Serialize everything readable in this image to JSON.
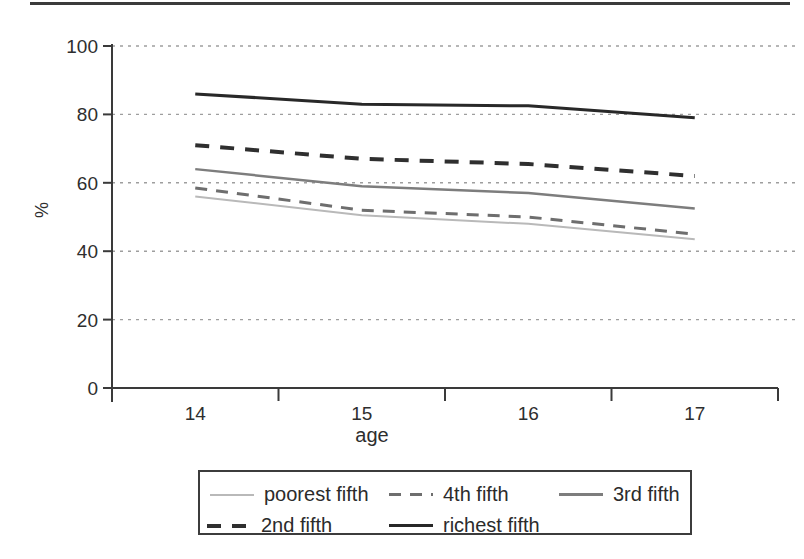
{
  "chart_data": {
    "type": "line",
    "title": "",
    "xlabel": "age",
    "ylabel": "%",
    "x": [
      "14",
      "15",
      "16",
      "17"
    ],
    "ylim": [
      0,
      100
    ],
    "yticks": [
      0,
      20,
      40,
      60,
      80,
      100
    ],
    "grid": "horizontal-dashed",
    "legend_position": "bottom-box",
    "axis_color": "#3a3a3a",
    "gridline_color": "#9e9e9e",
    "series": [
      {
        "label": "poorest fifth",
        "values": [
          56,
          50.5,
          48,
          43.5
        ],
        "color": "#b9b9b9",
        "dash": null,
        "width": 2
      },
      {
        "label": "4th fifth",
        "values": [
          58.5,
          52,
          50,
          45
        ],
        "color": "#6e6e6e",
        "dash": [
          12,
          9
        ],
        "width": 3
      },
      {
        "label": "3rd fifth",
        "values": [
          64,
          59,
          57,
          52.5
        ],
        "color": "#7d7d7d",
        "dash": null,
        "width": 2.5
      },
      {
        "label": "2nd fifth",
        "values": [
          71,
          67,
          65.5,
          62
        ],
        "color": "#2f2f2f",
        "dash": [
          14,
          11
        ],
        "width": 4
      },
      {
        "label": "richest fifth",
        "values": [
          86,
          83,
          82.5,
          79
        ],
        "color": "#282828",
        "dash": null,
        "width": 3
      }
    ]
  }
}
